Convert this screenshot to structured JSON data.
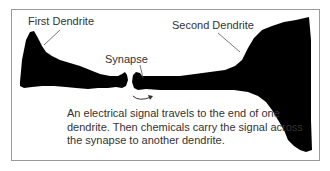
{
  "diagram": {
    "labels": {
      "first_dendrite": "First Dendrite",
      "second_dendrite": "Second Dendrite",
      "synapse": "Synapse"
    },
    "caption": "An electrical signal travels to the end of one dendrite. Then chemicals carry the signal across the synapse to another dendrite.",
    "colors": {
      "dendrite_fill": "#000000",
      "frame_border": "#9a9a9a",
      "text": "#333333",
      "leader_line": "#555555"
    },
    "icons": {
      "signal_arrow": "curved-arrow-icon"
    }
  }
}
